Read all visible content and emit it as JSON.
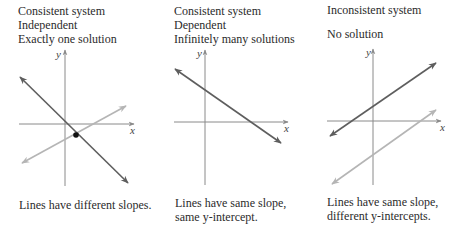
{
  "panels": [
    {
      "id": "consistent-independent",
      "header": [
        "Consistent system",
        "Independent",
        "Exactly one solution"
      ],
      "caption": [
        "Lines have different slopes."
      ],
      "axis_labels": {
        "x": "x",
        "y": "y"
      }
    },
    {
      "id": "consistent-dependent",
      "header": [
        "Consistent system",
        "Dependent",
        "Infinitely many solutions"
      ],
      "caption": [
        "Lines have same slope,",
        "same y-intercept."
      ],
      "axis_labels": {
        "x": "x",
        "y": "y"
      }
    },
    {
      "id": "inconsistent",
      "header": [
        "Inconsistent system",
        "",
        "No solution"
      ],
      "caption": [
        "Lines have same slope,",
        "different y-intercepts."
      ],
      "axis_labels": {
        "x": "x",
        "y": "y"
      }
    }
  ],
  "colors": {
    "axis": "#8a8a8a",
    "dark_line": "#5e5e5e",
    "light_line": "#b5b5b5",
    "intersection_point": "#111111",
    "text": "#2b2b2b"
  }
}
